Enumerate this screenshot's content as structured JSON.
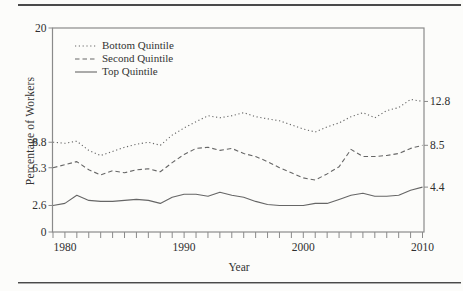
{
  "figure": {
    "y_axis_title": "Percentage of Workers",
    "x_axis_title": "Year",
    "colors": {
      "text": "#2f2f2f",
      "line": "#666666",
      "axis": "#8a8a8a",
      "rule": "#4a4a4a",
      "background": "#fcfcfa"
    }
  },
  "chart_data": {
    "type": "line",
    "title": "",
    "xlabel": "Year",
    "ylabel": "Percentage of Workers",
    "xlim": [
      1979,
      2010
    ],
    "ylim": [
      0,
      20
    ],
    "grid": false,
    "legend_position": "top-left",
    "x_tick_labels": [
      1980,
      1990,
      2000,
      2010
    ],
    "x_minor_tick_step": 1,
    "left_axis_ticks": [
      {
        "value": 20,
        "label": "20"
      },
      {
        "value": 8.8,
        "label": "8.8"
      },
      {
        "value": 6.3,
        "label": "6.3"
      },
      {
        "value": 2.6,
        "label": "2.6"
      },
      {
        "value": 0,
        "label": "0"
      }
    ],
    "right_end_labels": [
      {
        "value": 12.8,
        "label": "12.8",
        "series": "Bottom Quintile"
      },
      {
        "value": 8.5,
        "label": "8.5",
        "series": "Second Quintile"
      },
      {
        "value": 4.4,
        "label": "4.4",
        "series": "Top Quintile"
      }
    ],
    "x": [
      1979,
      1980,
      1981,
      1982,
      1983,
      1984,
      1985,
      1986,
      1987,
      1988,
      1989,
      1990,
      1991,
      1992,
      1993,
      1994,
      1995,
      1996,
      1997,
      1998,
      1999,
      2000,
      2001,
      2002,
      2003,
      2004,
      2005,
      2006,
      2007,
      2008,
      2009,
      2010
    ],
    "series": [
      {
        "name": "Bottom Quintile",
        "style": "dotted",
        "values": [
          8.8,
          8.7,
          8.9,
          8.0,
          7.5,
          7.9,
          8.3,
          8.6,
          8.8,
          8.5,
          9.5,
          10.2,
          10.8,
          11.4,
          11.2,
          11.4,
          11.7,
          11.3,
          11.1,
          10.9,
          10.5,
          10.1,
          9.8,
          10.3,
          10.7,
          11.3,
          11.7,
          11.2,
          11.9,
          12.2,
          13.0,
          12.8
        ]
      },
      {
        "name": "Second Quintile",
        "style": "dashed",
        "values": [
          6.3,
          6.6,
          6.9,
          6.1,
          5.6,
          6.0,
          5.8,
          6.1,
          6.2,
          5.9,
          6.8,
          7.6,
          8.2,
          8.3,
          8.0,
          8.2,
          7.7,
          7.4,
          6.9,
          6.3,
          5.8,
          5.3,
          5.1,
          5.7,
          6.4,
          8.1,
          7.4,
          7.4,
          7.5,
          7.7,
          8.2,
          8.5
        ]
      },
      {
        "name": "Top Quintile",
        "style": "solid",
        "values": [
          2.6,
          2.8,
          3.6,
          3.1,
          3.0,
          3.0,
          3.1,
          3.2,
          3.1,
          2.8,
          3.4,
          3.7,
          3.7,
          3.5,
          3.9,
          3.6,
          3.4,
          3.0,
          2.7,
          2.6,
          2.6,
          2.6,
          2.8,
          2.8,
          3.2,
          3.6,
          3.8,
          3.5,
          3.5,
          3.6,
          4.1,
          4.4
        ]
      }
    ]
  }
}
